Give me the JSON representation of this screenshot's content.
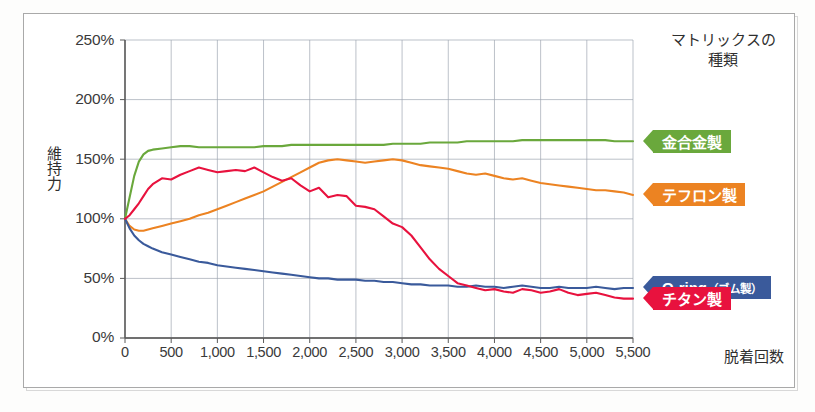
{
  "legend": {
    "title_line1": "マトリックスの",
    "title_line2": "種類",
    "items": [
      {
        "label": "金合金製",
        "color": "#6aa83c",
        "sub": ""
      },
      {
        "label": "テフロン製",
        "color": "#ec8322",
        "sub": ""
      },
      {
        "label": "O-ring",
        "color": "#3a5a9b",
        "sub": "（ゴム製）"
      },
      {
        "label": "チタン製",
        "color": "#e8123e",
        "sub": ""
      }
    ]
  },
  "axes": {
    "y_title": "維持力",
    "x_title": "脱着回数",
    "y_ticks": [
      "0%",
      "50%",
      "100%",
      "150%",
      "200%",
      "250%"
    ],
    "x_ticks": [
      "0",
      "500",
      "1,000",
      "1,500",
      "2,000",
      "2,500",
      "3,000",
      "3,500",
      "4,000",
      "4,500",
      "5,000",
      "5,500"
    ]
  },
  "chart_data": {
    "type": "line",
    "title": "",
    "xlabel": "脱着回数",
    "ylabel": "維持力",
    "xlim": [
      0,
      5500
    ],
    "ylim": [
      0,
      250
    ],
    "y_unit": "%",
    "grid": true,
    "legend_position": "right",
    "x_tick_step": 500,
    "y_tick_step": 50,
    "x": [
      0,
      50,
      100,
      150,
      200,
      250,
      300,
      400,
      500,
      600,
      700,
      800,
      900,
      1000,
      1100,
      1200,
      1300,
      1400,
      1500,
      1600,
      1700,
      1800,
      1900,
      2000,
      2100,
      2200,
      2300,
      2400,
      2500,
      2600,
      2700,
      2800,
      2900,
      3000,
      3100,
      3200,
      3300,
      3400,
      3500,
      3600,
      3700,
      3800,
      3900,
      4000,
      4100,
      4200,
      4300,
      4400,
      4500,
      4600,
      4700,
      4800,
      4900,
      5000,
      5100,
      5200,
      5300,
      5400,
      5500
    ],
    "series": [
      {
        "name": "金合金製",
        "color": "#6aa83c",
        "values": [
          100,
          118,
          136,
          148,
          154,
          157,
          158,
          159,
          160,
          161,
          161,
          160,
          160,
          160,
          160,
          160,
          160,
          160,
          161,
          161,
          161,
          162,
          162,
          162,
          162,
          162,
          162,
          162,
          162,
          162,
          162,
          162,
          163,
          163,
          163,
          163,
          164,
          164,
          164,
          164,
          165,
          165,
          165,
          165,
          165,
          165,
          166,
          166,
          166,
          166,
          166,
          166,
          166,
          166,
          166,
          166,
          165,
          165,
          165
        ]
      },
      {
        "name": "テフロン製",
        "color": "#ec8322",
        "values": [
          100,
          94,
          91,
          90,
          90,
          91,
          92,
          94,
          96,
          98,
          100,
          103,
          105,
          108,
          111,
          114,
          117,
          120,
          123,
          127,
          131,
          135,
          139,
          143,
          147,
          149,
          150,
          149,
          148,
          147,
          148,
          149,
          150,
          149,
          147,
          145,
          144,
          143,
          142,
          140,
          138,
          137,
          138,
          136,
          134,
          133,
          134,
          132,
          130,
          129,
          128,
          127,
          126,
          125,
          124,
          124,
          123,
          122,
          120
        ]
      },
      {
        "name": "O-ring（ゴム製）",
        "color": "#3a5a9b",
        "values": [
          100,
          92,
          86,
          82,
          79,
          77,
          75,
          72,
          70,
          68,
          66,
          64,
          63,
          61,
          60,
          59,
          58,
          57,
          56,
          55,
          54,
          53,
          52,
          51,
          50,
          50,
          49,
          49,
          49,
          48,
          48,
          47,
          47,
          46,
          45,
          45,
          44,
          44,
          44,
          43,
          43,
          44,
          43,
          43,
          42,
          43,
          44,
          43,
          42,
          42,
          43,
          42,
          42,
          42,
          43,
          42,
          41,
          42,
          42
        ]
      },
      {
        "name": "チタン製",
        "color": "#e8123e",
        "values": [
          100,
          103,
          108,
          113,
          119,
          125,
          129,
          134,
          133,
          137,
          140,
          143,
          141,
          139,
          140,
          141,
          140,
          143,
          139,
          135,
          132,
          134,
          128,
          123,
          126,
          118,
          120,
          119,
          111,
          110,
          108,
          102,
          96,
          93,
          86,
          76,
          66,
          58,
          52,
          46,
          44,
          42,
          40,
          41,
          39,
          38,
          41,
          40,
          38,
          39,
          41,
          38,
          36,
          37,
          38,
          36,
          34,
          33,
          33
        ]
      }
    ]
  }
}
